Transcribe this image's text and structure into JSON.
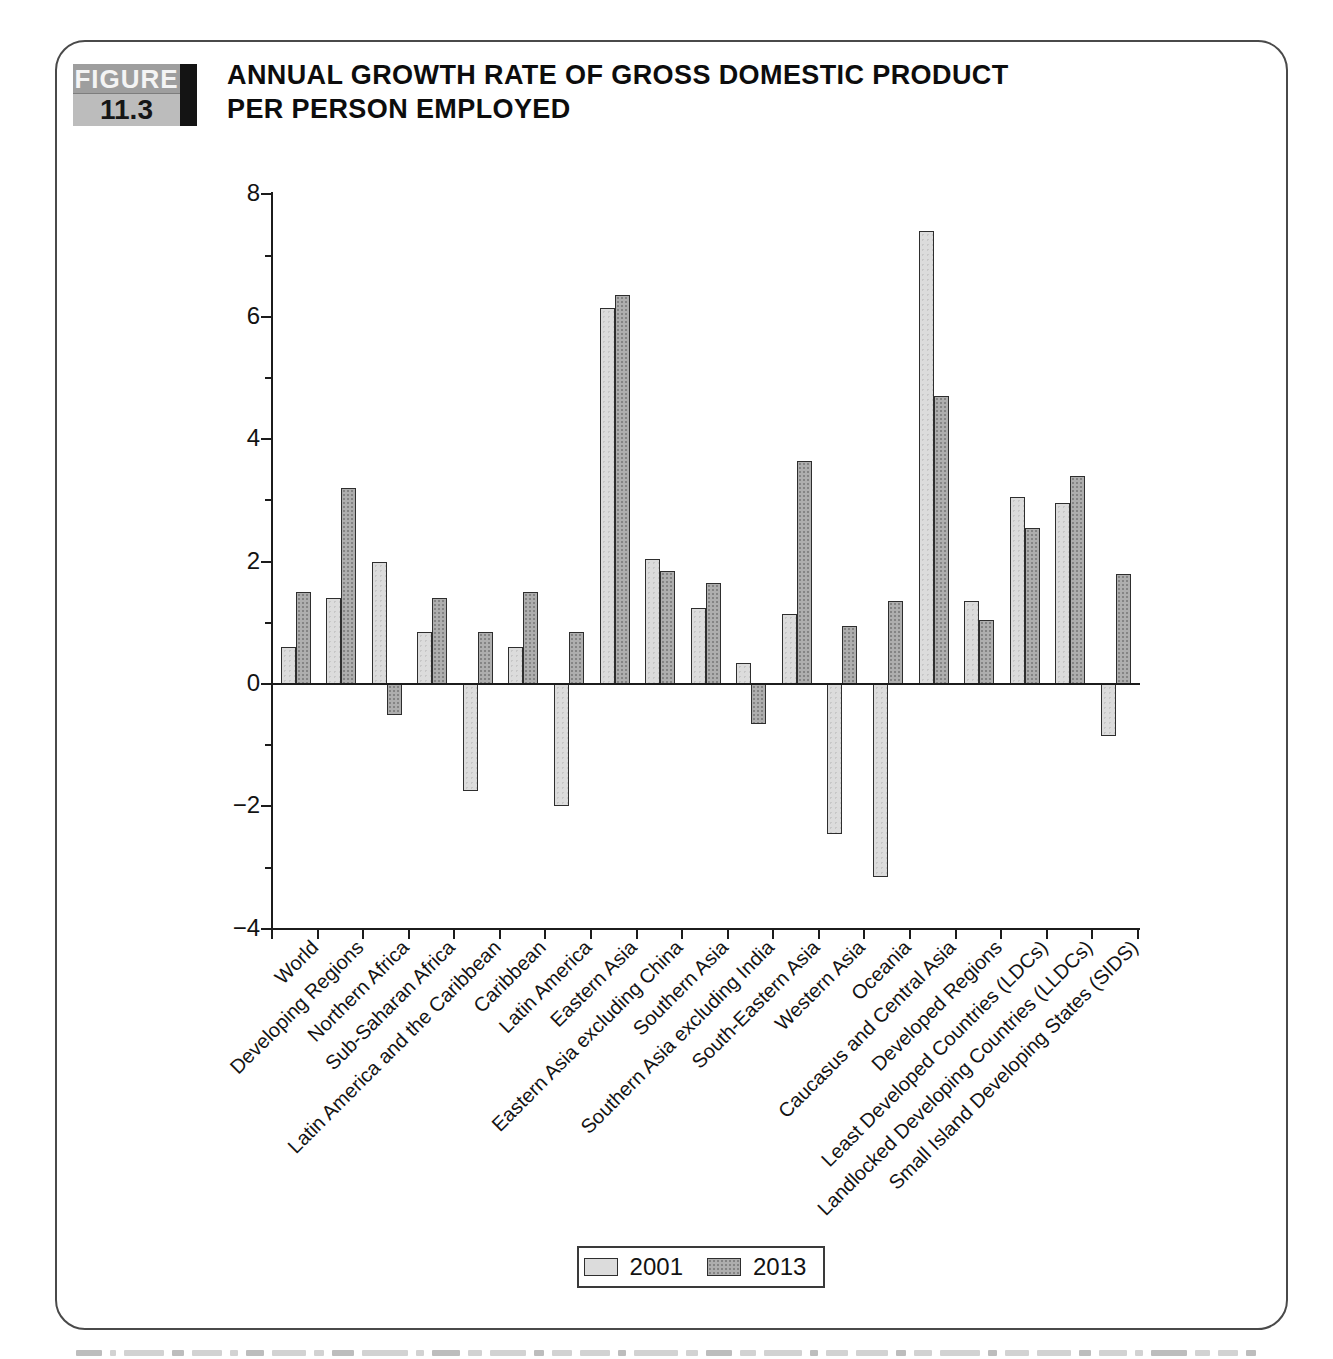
{
  "figure_label": {
    "word": "FIGURE",
    "number": "11.3"
  },
  "title": {
    "line1": "ANNUAL GROWTH RATE OF GROSS DOMESTIC PRODUCT",
    "line2": "PER PERSON EMPLOYED"
  },
  "legend": {
    "items": [
      {
        "label": "2001",
        "swatch": "light"
      },
      {
        "label": "2013",
        "swatch": "dark"
      }
    ]
  },
  "colors": {
    "bar_2001": "#dcdcdc",
    "bar_2013": "#aeaeae",
    "bar_border": "#2e2e2e",
    "axis": "#1c1c1c",
    "panel_border": "#4a4a4a",
    "figure_block_top_bg": "#9e9e9e",
    "figure_block_bottom_bg": "#bcbcbc",
    "figure_block_accent": "#141414"
  },
  "chart_data": {
    "type": "bar",
    "title": "ANNUAL GROWTH RATE OF GROSS DOMESTIC PRODUCT PER PERSON EMPLOYED",
    "categories": [
      "World",
      "Developing Regions",
      "Northern Africa",
      "Sub-Saharan Africa",
      "Latin America and the Caribbean",
      "Caribbean",
      "Latin America",
      "Eastern Asia",
      "Eastern Asia excluding China",
      "Southern Asia",
      "Southern Asia excluding India",
      "South-Eastern Asia",
      "Western Asia",
      "Oceania",
      "Caucasus and Central Asia",
      "Developed Regions",
      "Least Developed Countries (LDCs)",
      "Landlocked Developing Countries (LLDCs)",
      "Small Island Developing States (SIDS)"
    ],
    "series": [
      {
        "name": "2001",
        "values": [
          0.6,
          1.4,
          2.0,
          0.85,
          -1.75,
          0.6,
          -2.0,
          6.15,
          2.05,
          1.25,
          0.35,
          1.15,
          -2.45,
          -3.15,
          7.4,
          1.35,
          3.05,
          2.95,
          -0.85
        ]
      },
      {
        "name": "2013",
        "values": [
          1.5,
          3.2,
          -0.5,
          1.4,
          0.85,
          1.5,
          0.85,
          6.35,
          1.85,
          1.65,
          -0.65,
          3.65,
          0.95,
          1.35,
          4.7,
          1.05,
          2.55,
          3.4,
          1.8
        ]
      }
    ],
    "ylim": [
      -4,
      8
    ],
    "yticks": [
      8,
      6,
      4,
      2,
      0,
      -2,
      -4
    ],
    "ytick_labels": [
      "8",
      "6",
      "4",
      "2",
      "0",
      "−2",
      "−4"
    ],
    "xlabel": "",
    "ylabel": "",
    "grid": false,
    "legend_position": "bottom-center",
    "bar_orientation": "vertical"
  }
}
